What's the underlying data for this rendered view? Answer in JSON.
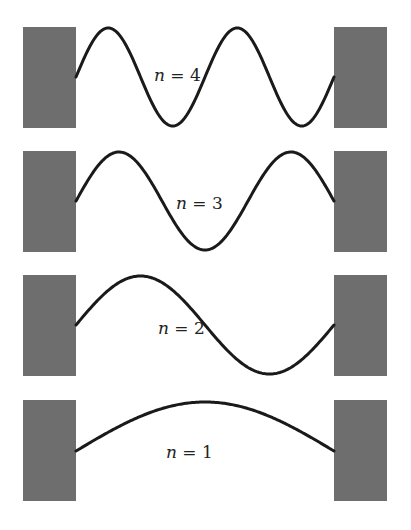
{
  "figure": {
    "colors": {
      "wall": "#6e6e6e",
      "wave": "#1a1a1a",
      "background": "#ffffff",
      "text": "#222222"
    },
    "layout": {
      "left_wall_x": 23,
      "right_wall_x": 334,
      "wall_width": 53,
      "wall_height": 101,
      "string_start_x": 76,
      "string_end_x": 334,
      "amplitude": 49
    },
    "modes": [
      {
        "n": 4,
        "label_var": "n",
        "label_eq": " = ",
        "label_val": "4",
        "center_y": 77,
        "wall_top": 27,
        "label_x": 154,
        "label_y": 81
      },
      {
        "n": 3,
        "label_var": "n",
        "label_eq": " = ",
        "label_val": "3",
        "center_y": 201,
        "wall_top": 151,
        "label_x": 176,
        "label_y": 209
      },
      {
        "n": 2,
        "label_var": "n",
        "label_eq": " = ",
        "label_val": "2",
        "center_y": 325,
        "wall_top": 275,
        "label_x": 158,
        "label_y": 334
      },
      {
        "n": 1,
        "label_var": "n",
        "label_eq": " = ",
        "label_val": "1",
        "center_y": 451,
        "wall_top": 400,
        "label_x": 166,
        "label_y": 458
      }
    ]
  }
}
